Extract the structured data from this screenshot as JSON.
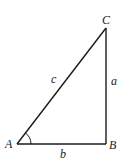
{
  "diagram": {
    "type": "right-triangle",
    "vertices": {
      "A": {
        "label": "A",
        "x": 17,
        "y": 144
      },
      "B": {
        "label": "B",
        "x": 106,
        "y": 144
      },
      "C": {
        "label": "C",
        "x": 106,
        "y": 28
      }
    },
    "sides": {
      "a": {
        "label": "a",
        "between": "B-C"
      },
      "b": {
        "label": "b",
        "between": "A-B"
      },
      "c": {
        "label": "c",
        "between": "A-C"
      }
    },
    "angle_marker": {
      "at": "A"
    },
    "colors": {
      "stroke": "#1a1a1a",
      "background": "#ffffff"
    }
  }
}
